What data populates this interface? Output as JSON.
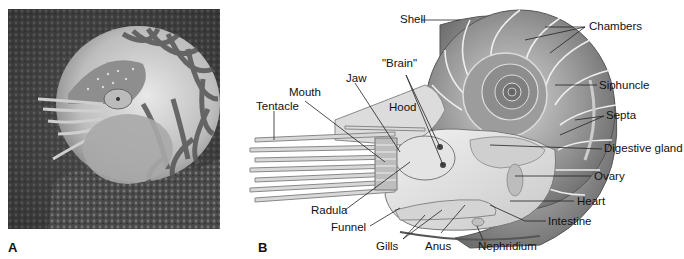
{
  "figure": {
    "panels": [
      {
        "letter": "A",
        "description": "Photograph of a chambered nautilus with striped shell resting on coral reef"
      },
      {
        "letter": "B",
        "description": "Cutaway anatomical diagram of a nautilus"
      }
    ]
  },
  "panel_a": {
    "letter": "A"
  },
  "panel_b": {
    "letter": "B",
    "labels": {
      "shell": "Shell",
      "chambers": "Chambers",
      "siphuncle": "Siphuncle",
      "septa": "Septa",
      "digestive_gland": "Digestive gland",
      "ovary": "Ovary",
      "heart": "Heart",
      "intestine": "Intestine",
      "nephridium": "Nephridium",
      "anus": "Anus",
      "gills": "Gills",
      "funnel": "Funnel",
      "radula": "Radula",
      "tentacle": "Tentacle",
      "mouth": "Mouth",
      "jaw": "Jaw",
      "brain": "\"Brain\"",
      "hood": "Hood"
    }
  }
}
